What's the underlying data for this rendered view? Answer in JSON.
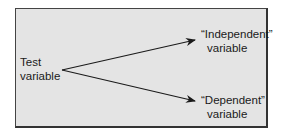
{
  "diagram": {
    "source": {
      "line1": "Test",
      "line2": "variable"
    },
    "targets": [
      {
        "line1": "“Independent”",
        "line2": "variable"
      },
      {
        "line1": "“Dependent”",
        "line2": "variable"
      }
    ],
    "colors": {
      "panel": "#e4e4e4",
      "border": "#444444",
      "stroke": "#1a1a1a"
    }
  }
}
